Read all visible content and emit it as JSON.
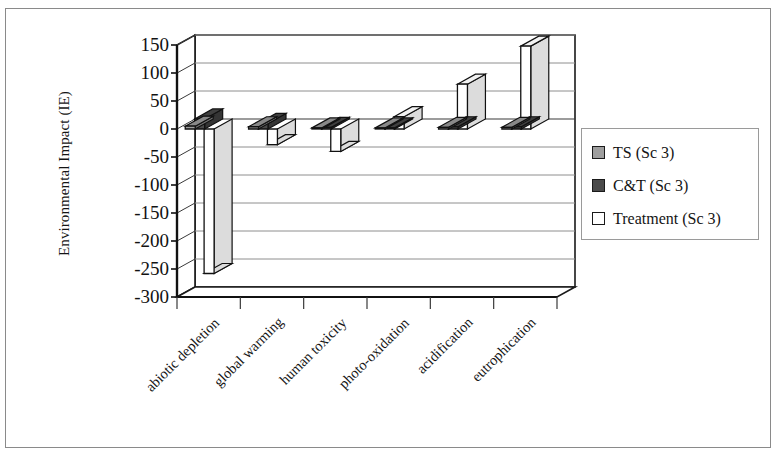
{
  "chart_data": {
    "type": "bar",
    "title": "",
    "subtitle": "",
    "xlabel": "",
    "ylabel": "Environmental Impact (IE)",
    "ylim": [
      -300,
      150
    ],
    "ytick_step": 50,
    "yticks": [
      150,
      100,
      50,
      0,
      -50,
      -100,
      -150,
      -200,
      -250,
      -300
    ],
    "grid": true,
    "three_d": true,
    "legend_position": "right",
    "categories": [
      "abiotic depletion",
      "global warming",
      "human toxicity",
      "photo-oxidation",
      "acidification",
      "eutrophication"
    ],
    "series": [
      {
        "name": "TS (Sc 3)",
        "color": "#9e9e9e",
        "values": [
          5,
          4,
          2,
          2,
          3,
          3
        ]
      },
      {
        "name": "C&T (Sc 3)",
        "color": "#4a4a4a",
        "values": [
          18,
          10,
          3,
          2,
          4,
          4
        ]
      },
      {
        "name": "Treatment (Sc 3)",
        "color": "#ffffff",
        "values": [
          -258,
          -28,
          -40,
          22,
          80,
          148
        ]
      }
    ]
  },
  "legend": {
    "items": [
      {
        "label": "TS (Sc 3)",
        "swatch": "#9e9e9e"
      },
      {
        "label": "C&T (Sc 3)",
        "swatch": "#4a4a4a"
      },
      {
        "label": "Treatment (Sc 3)",
        "swatch": "#ffffff"
      }
    ]
  },
  "axis": {
    "y_title": "Environmental Impact (IE)",
    "y_labels": [
      "150",
      "100",
      "50",
      "0",
      "-50",
      "-100",
      "-150",
      "-200",
      "-250",
      "-300"
    ],
    "x_labels": [
      "abiotic depletion",
      "global warming",
      "human toxicity",
      "photo-oxidation",
      "acidification",
      "eutrophication"
    ]
  }
}
